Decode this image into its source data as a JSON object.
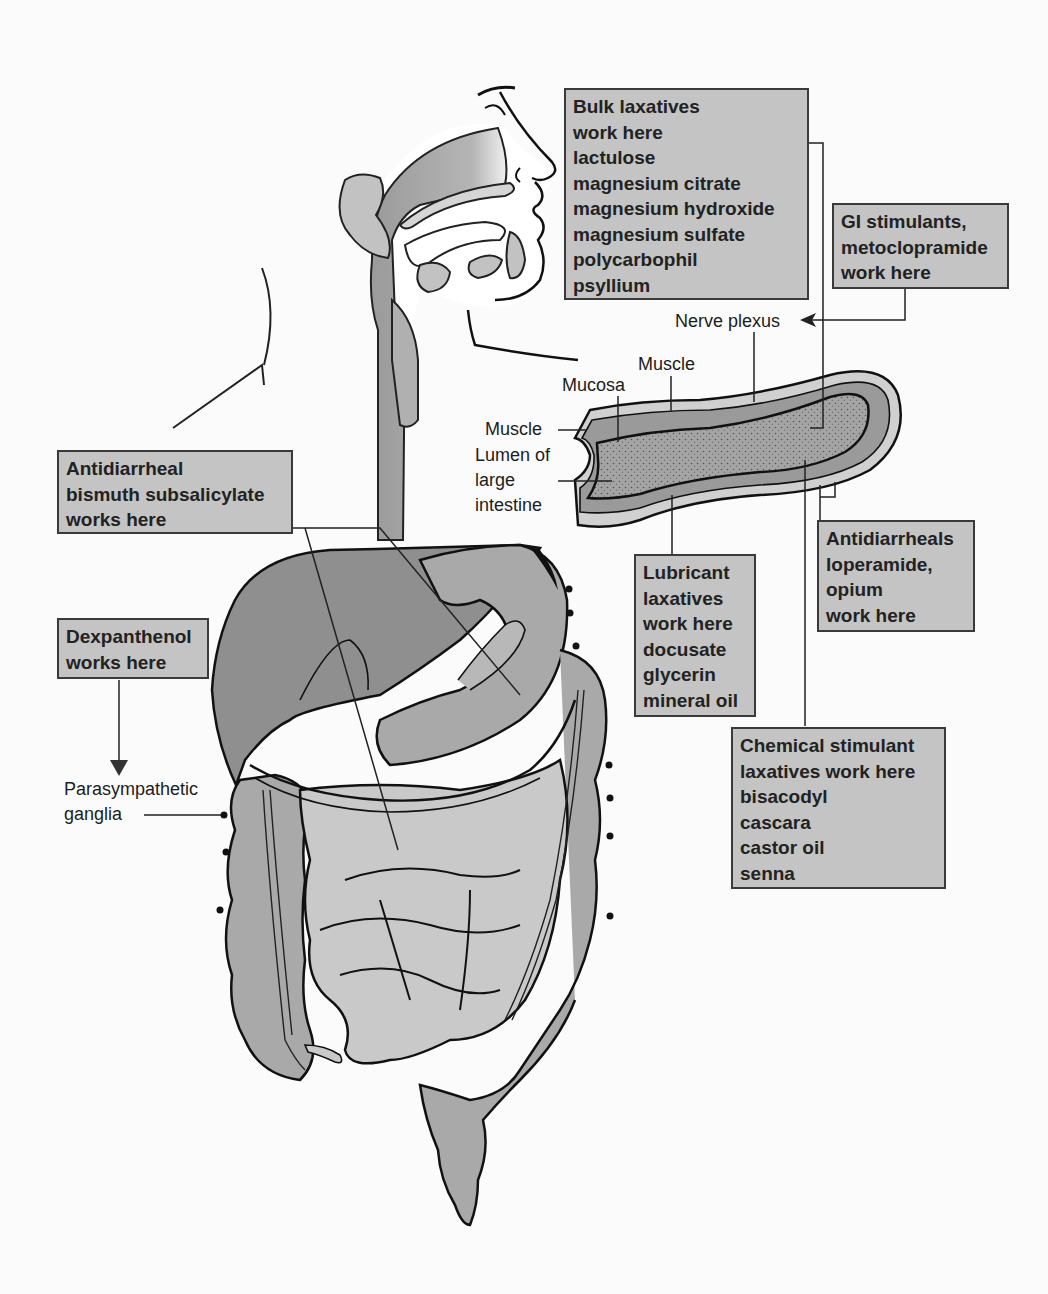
{
  "diagram": {
    "colors": {
      "box_fill": "#c4c4c4",
      "box_border": "#3a3a3a",
      "organ_dark": "#8f8f8f",
      "organ_mid": "#a9a9a9",
      "organ_light": "#c9c9c9",
      "background": "#fbfbfb"
    },
    "boxes": {
      "bulk_laxatives": {
        "lines": [
          "Bulk laxatives",
          "work here",
          "lactulose",
          "magnesium citrate",
          "magnesium hydroxide",
          "magnesium sulfate",
          "polycarbophil",
          "psyllium"
        ]
      },
      "gi_stimulants": {
        "lines": [
          "GI stimulants,",
          "metoclopramide",
          "work here"
        ]
      },
      "antidiarrheal_bismuth": {
        "lines": [
          "Antidiarrheal",
          "bismuth subsalicylate",
          "works here"
        ]
      },
      "dexpanthenol": {
        "lines": [
          "Dexpanthenol",
          "works here"
        ]
      },
      "antidiarrheals_loperamide": {
        "lines": [
          "Antidiarrheals",
          "loperamide,",
          "opium",
          "work here"
        ]
      },
      "lubricant_laxatives": {
        "lines": [
          "Lubricant",
          "laxatives",
          "work here",
          "docusate",
          "glycerin",
          "mineral oil"
        ]
      },
      "chemical_stimulant": {
        "lines": [
          "Chemical stimulant",
          "laxatives work here",
          "bisacodyl",
          "cascara",
          "castor oil",
          "senna"
        ]
      }
    },
    "labels": {
      "nerve_plexus": "Nerve plexus",
      "muscle_outer": "Muscle",
      "mucosa": "Mucosa",
      "muscle_inner": "Muscle",
      "lumen": [
        "Lumen of",
        "large",
        "intestine"
      ],
      "parasympathetic": [
        "Parasympathetic",
        "ganglia"
      ]
    }
  }
}
